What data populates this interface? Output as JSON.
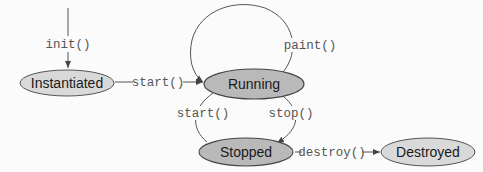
{
  "diagram": {
    "states": [
      {
        "id": "instantiated",
        "label": "Instantiated",
        "fill": "#d9d9d9"
      },
      {
        "id": "running",
        "label": "Running",
        "fill": "#b9b9b9"
      },
      {
        "id": "stopped",
        "label": "Stopped",
        "fill": "#b9b9b9"
      },
      {
        "id": "destroyed",
        "label": "Destroyed",
        "fill": "#d9d9d9"
      }
    ],
    "transitions": [
      {
        "id": "init",
        "label": "init()",
        "from": "",
        "to": "instantiated"
      },
      {
        "id": "start1",
        "label": "start()",
        "from": "instantiated",
        "to": "running"
      },
      {
        "id": "paint",
        "label": "paint()",
        "from": "running",
        "to": "running"
      },
      {
        "id": "stop",
        "label": "stop()",
        "from": "running",
        "to": "stopped"
      },
      {
        "id": "start2",
        "label": "start()",
        "from": "stopped",
        "to": "running"
      },
      {
        "id": "destroy",
        "label": "destroy()",
        "from": "stopped",
        "to": "destroyed"
      }
    ]
  }
}
